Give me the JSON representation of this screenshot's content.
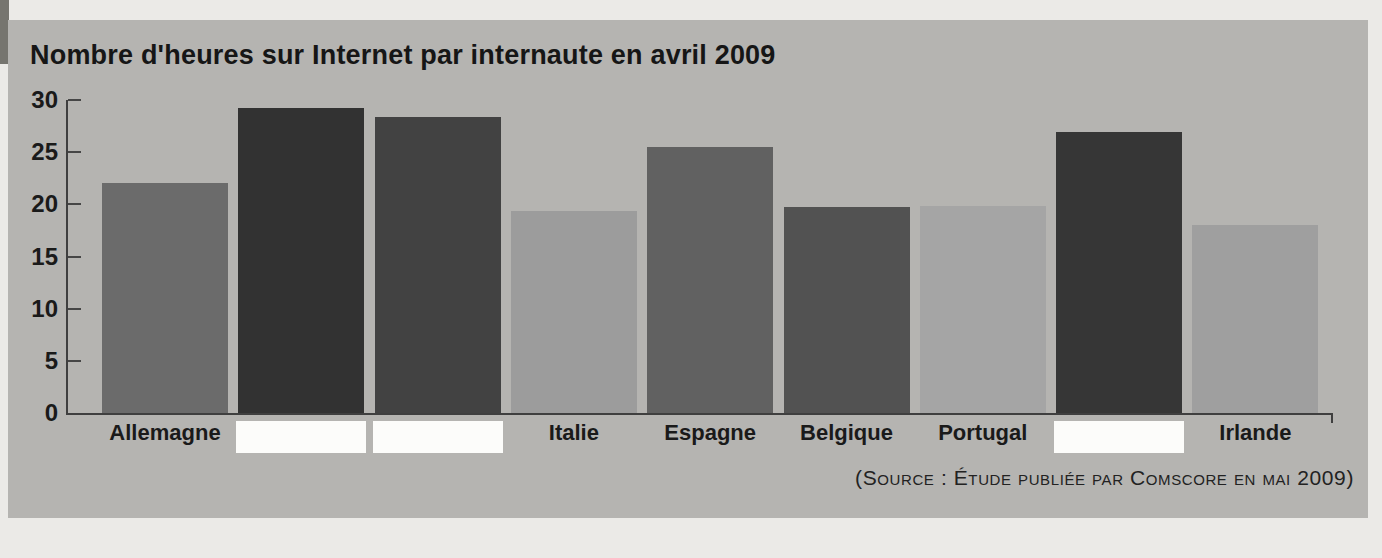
{
  "source_caption": "(Source : Étude publiée par Comscore en mai 2009)",
  "colors": {
    "page_background": "#ebeae7",
    "panel_background": "#b5b4b1",
    "axis": "#3f3f3f",
    "text": "#1a1a1a",
    "hidden_label_box": "#fcfcfa"
  },
  "chart_data": {
    "type": "bar",
    "title": "Nombre d'heures sur Internet par internaute en avril 2009",
    "xlabel": "",
    "ylabel": "",
    "ylim": [
      0,
      30
    ],
    "yticks": [
      0,
      5,
      10,
      15,
      20,
      25,
      30
    ],
    "grid": false,
    "legend": "none",
    "categories": [
      "Allemagne",
      "",
      "",
      "Italie",
      "Espagne",
      "Belgique",
      "Portugal",
      "",
      "Irlande"
    ],
    "values": [
      22,
      29.2,
      28.4,
      19.4,
      25.5,
      19.7,
      19.8,
      26.9,
      18
    ],
    "hidden_labels": [
      false,
      true,
      true,
      false,
      false,
      false,
      false,
      true,
      false
    ],
    "bar_colors": [
      "#6b6b6b",
      "#323232",
      "#424242",
      "#9c9c9c",
      "#616161",
      "#525252",
      "#a5a5a5",
      "#363636",
      "#9f9f9f"
    ]
  }
}
